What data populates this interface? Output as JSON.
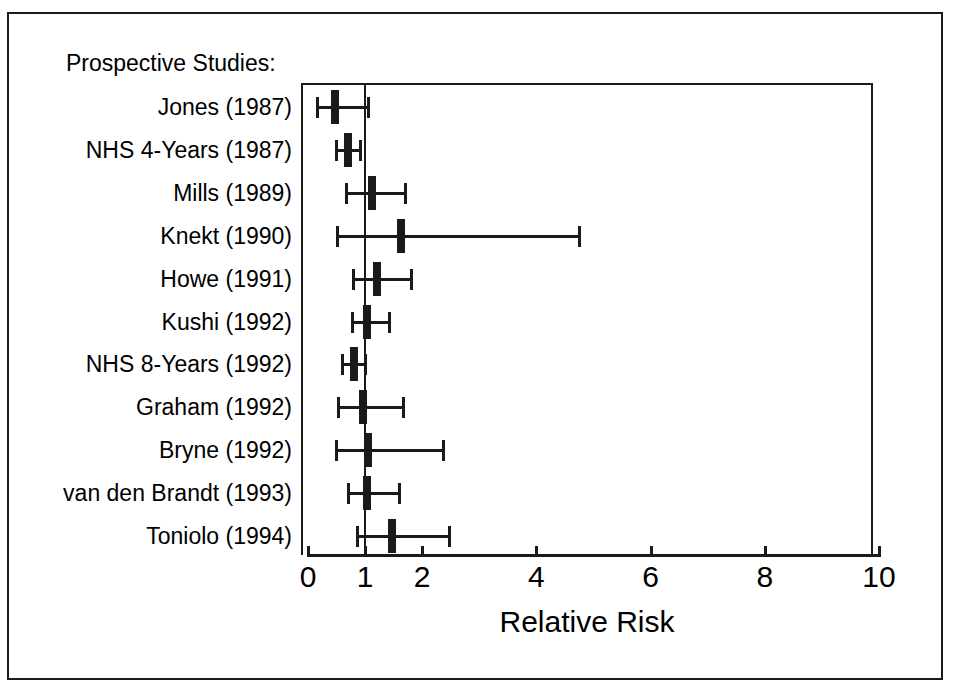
{
  "figure": {
    "section_heading": "Prospective Studies:",
    "x_axis_title": "Relative Risk"
  },
  "chart_data": {
    "type": "scatter",
    "subtype": "forest-plot",
    "title": "Prospective Studies:",
    "xlabel": "Relative Risk",
    "ylabel": "",
    "xlim": [
      0,
      10
    ],
    "xticks": [
      0,
      1,
      2,
      4,
      6,
      8,
      10
    ],
    "xtick_labels": [
      "0",
      "1",
      "2",
      "4",
      "6",
      "8",
      "10"
    ],
    "scale": "linear",
    "grid": false,
    "legend": null,
    "reference_line": 1,
    "effect_measure": "Relative Risk",
    "categories": [
      "Jones (1987)",
      "NHS 4-Years (1987)",
      "Mills (1989)",
      "Knekt (1990)",
      "Howe (1991)",
      "Kushi (1992)",
      "NHS 8-Years (1992)",
      "Graham (1992)",
      "Bryne (1992)",
      "van den Brandt (1993)",
      "Toniolo (1994)"
    ],
    "values": [
      0.47,
      0.7,
      1.12,
      1.63,
      1.21,
      1.04,
      0.81,
      0.97,
      1.05,
      1.04,
      1.47
    ],
    "ci_low": [
      0.16,
      0.49,
      0.67,
      0.51,
      0.79,
      0.77,
      0.6,
      0.53,
      0.49,
      0.7,
      0.86
    ],
    "ci_high": [
      1.05,
      0.91,
      1.7,
      4.75,
      1.8,
      1.42,
      1.0,
      1.66,
      2.37,
      1.59,
      2.47
    ],
    "points": [
      {
        "label": "Jones (1987)",
        "rr": 0.47,
        "low": 0.16,
        "high": 1.05
      },
      {
        "label": "NHS 4-Years (1987)",
        "rr": 0.7,
        "low": 0.49,
        "high": 0.91
      },
      {
        "label": "Mills (1989)",
        "rr": 1.12,
        "low": 0.67,
        "high": 1.7
      },
      {
        "label": "Knekt (1990)",
        "rr": 1.63,
        "low": 0.51,
        "high": 4.75
      },
      {
        "label": "Howe (1991)",
        "rr": 1.21,
        "low": 0.79,
        "high": 1.8
      },
      {
        "label": "Kushi (1992)",
        "rr": 1.04,
        "low": 0.77,
        "high": 1.42
      },
      {
        "label": "NHS 8-Years (1992)",
        "rr": 0.81,
        "low": 0.6,
        "high": 1.0
      },
      {
        "label": "Graham (1992)",
        "rr": 0.97,
        "low": 0.53,
        "high": 1.66
      },
      {
        "label": "Bryne (1992)",
        "rr": 1.05,
        "low": 0.49,
        "high": 2.37
      },
      {
        "label": "van den Brandt (1993)",
        "rr": 1.04,
        "low": 0.7,
        "high": 1.59
      },
      {
        "label": "Toniolo (1994)",
        "rr": 1.47,
        "low": 0.86,
        "high": 2.47
      }
    ],
    "colors": {
      "marker": "#1a1a1a",
      "line": "#1a1a1a",
      "background": "#ffffff"
    }
  }
}
